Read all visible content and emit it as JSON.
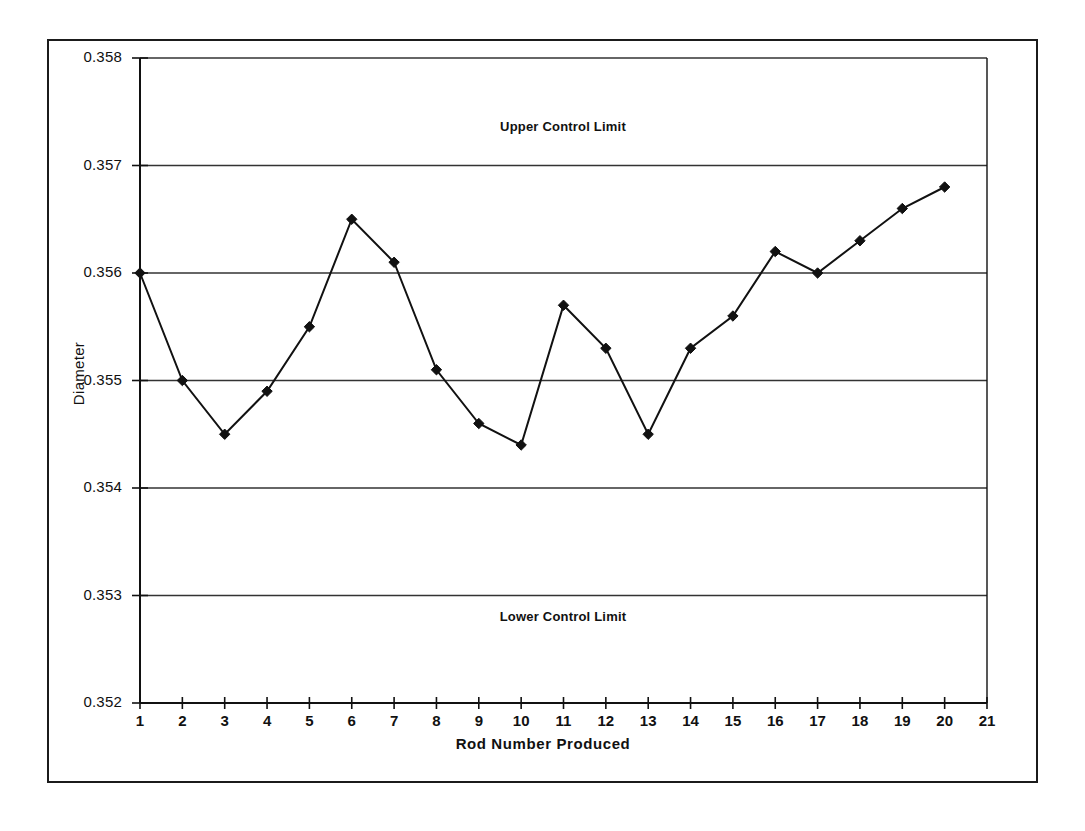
{
  "chart_data": {
    "type": "line",
    "title": "",
    "xlabel": "Rod Number Produced",
    "ylabel": "Diameter",
    "x": [
      1,
      2,
      3,
      4,
      5,
      6,
      7,
      8,
      9,
      10,
      11,
      12,
      13,
      14,
      15,
      16,
      17,
      18,
      19,
      20
    ],
    "values": [
      0.356,
      0.355,
      0.3545,
      0.3549,
      0.3555,
      0.3565,
      0.3561,
      0.3551,
      0.3546,
      0.3544,
      0.3557,
      0.3553,
      0.3545,
      0.3553,
      0.3556,
      0.3562,
      0.356,
      0.3563,
      0.3566,
      0.3568
    ],
    "series": [
      {
        "name": "Diameter",
        "values": [
          0.356,
          0.355,
          0.3545,
          0.3549,
          0.3555,
          0.3565,
          0.3561,
          0.3551,
          0.3546,
          0.3544,
          0.3557,
          0.3553,
          0.3545,
          0.3553,
          0.3556,
          0.3562,
          0.356,
          0.3563,
          0.3566,
          0.3568
        ]
      }
    ],
    "xlim": [
      1,
      21
    ],
    "ylim": [
      0.352,
      0.358
    ],
    "xticks": [
      "1",
      "2",
      "3",
      "4",
      "5",
      "6",
      "7",
      "8",
      "9",
      "10",
      "11",
      "12",
      "13",
      "14",
      "15",
      "16",
      "17",
      "18",
      "19",
      "20",
      "21"
    ],
    "yticks": [
      "0.352",
      "0.353",
      "0.354",
      "0.355",
      "0.356",
      "0.357",
      "0.358"
    ],
    "grid": "horizontal",
    "legend": "none",
    "marker": "diamond",
    "line_color": "#111111",
    "marker_color": "#111111",
    "grid_color": "#333333",
    "annotations": [
      {
        "text": "Upper Control Limit",
        "x": 11,
        "y": 0.35745
      },
      {
        "text": "Lower Control Limit",
        "x": 11,
        "y": 0.35255
      }
    ]
  },
  "annotations": {
    "upper_control_limit": "Upper Control Limit",
    "lower_control_limit": "Lower Control Limit"
  },
  "axes": {
    "x_title": "Rod Number Produced",
    "y_title": "Diameter"
  },
  "yticks": {
    "t0": "0.352",
    "t1": "0.353",
    "t2": "0.354",
    "t3": "0.355",
    "t4": "0.356",
    "t5": "0.357",
    "t6": "0.358"
  },
  "xticks": {
    "t0": "1",
    "t1": "2",
    "t2": "3",
    "t3": "4",
    "t4": "5",
    "t5": "6",
    "t6": "7",
    "t7": "8",
    "t8": "9",
    "t9": "10",
    "t10": "11",
    "t11": "12",
    "t12": "13",
    "t13": "14",
    "t14": "15",
    "t15": "16",
    "t16": "17",
    "t17": "18",
    "t18": "19",
    "t19": "20",
    "t20": "21"
  }
}
